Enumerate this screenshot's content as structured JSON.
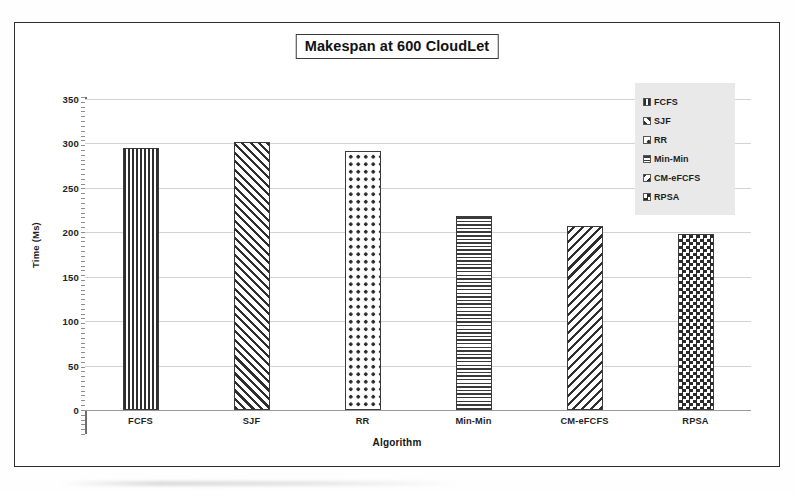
{
  "chart_data": {
    "type": "bar",
    "title": "Makespan at 600 CloudLet",
    "xlabel": "Algorithm",
    "ylabel": "Time (Ms)",
    "categories": [
      "FCFS",
      "SJF",
      "RR",
      "Min-Min",
      "CM-eFCFS",
      "RPSA"
    ],
    "values": [
      295,
      302,
      291,
      218,
      207,
      198
    ],
    "ylim": [
      0,
      350
    ],
    "ytick_labels": [
      "0",
      "50",
      "100",
      "150",
      "200",
      "250",
      "300",
      "350"
    ],
    "ytick_values": [
      0,
      50,
      100,
      150,
      200,
      250,
      300,
      350
    ],
    "grid": true,
    "legend_position": "top-right",
    "series": [
      {
        "name": "FCFS",
        "value": 295,
        "pattern": "vertical-lines"
      },
      {
        "name": "SJF",
        "value": 302,
        "pattern": "diagonal-hatch-back"
      },
      {
        "name": "RR",
        "value": 291,
        "pattern": "coarse-dots"
      },
      {
        "name": "Min-Min",
        "value": 218,
        "pattern": "horizontal-lines"
      },
      {
        "name": "CM-eFCFS",
        "value": 207,
        "pattern": "diagonal-hatch-forward"
      },
      {
        "name": "RPSA",
        "value": 198,
        "pattern": "fine-checkerboard"
      }
    ],
    "legend": [
      {
        "label": "FCFS",
        "pattern": "vertical-lines"
      },
      {
        "label": "SJF",
        "pattern": "diagonal-hatch-back"
      },
      {
        "label": "RR",
        "pattern": "coarse-dots"
      },
      {
        "label": "Min-Min",
        "pattern": "horizontal-lines"
      },
      {
        "label": "CM-eFCFS",
        "pattern": "diagonal-hatch-forward"
      },
      {
        "label": "RPSA",
        "pattern": "fine-checkerboard"
      }
    ],
    "colors": {
      "ink": "#2e2e2e",
      "gridline": "#d2d2d2",
      "axis": "#6e6e6e",
      "legend_background": "#e9e9e9",
      "plot_background": "#ffffff"
    }
  }
}
